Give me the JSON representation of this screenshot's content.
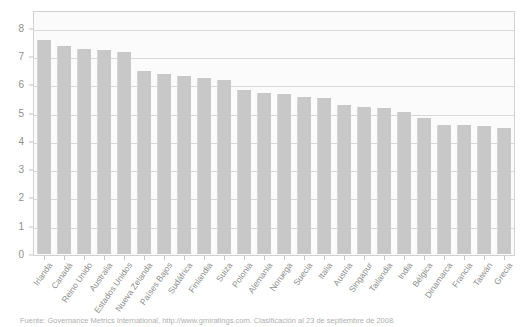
{
  "chart_data": {
    "type": "bar",
    "title": "",
    "subtitle": "",
    "xlabel": "",
    "ylabel": "",
    "ylim": [
      0,
      8.6
    ],
    "yticks": [
      0,
      1,
      2,
      3,
      4,
      5,
      6,
      7,
      8
    ],
    "ytick_labels": [
      "0",
      "1",
      "2",
      "3",
      "4",
      "5",
      "6",
      "7",
      "8"
    ],
    "grid": true,
    "legend": false,
    "legend_position": "none",
    "bar_color": "#c8c8c8",
    "categories": [
      "Irlanda",
      "Canadá",
      "Reino Unido",
      "Australia",
      "Estados Unidos",
      "Nueva Zelanda",
      "Países Bajos",
      "Sudáfrica",
      "Finlandia",
      "Suiza",
      "Polonia",
      "Alemania",
      "Noruega",
      "Suecia",
      "Italia",
      "Austria",
      "Singapur",
      "Tailandia",
      "India",
      "Bélgica",
      "Dinamarca",
      "Francia",
      "Taiwán",
      "Grecia"
    ],
    "values": [
      7.6,
      7.4,
      7.3,
      7.25,
      7.2,
      6.5,
      6.4,
      6.35,
      6.25,
      6.2,
      5.85,
      5.75,
      5.7,
      5.6,
      5.55,
      5.3,
      5.25,
      5.2,
      5.05,
      4.85,
      4.6,
      4.6,
      4.55,
      4.5
    ]
  },
  "axes": {
    "y_tick_labels": [
      "8",
      "7",
      "6",
      "5",
      "4",
      "3",
      "2",
      "1",
      "0"
    ]
  },
  "footer": {
    "source_note": "Fuente: Governance Metrics International, http://www.gmiratings.com. Clasificación al 23 de septiembre de 2008."
  }
}
